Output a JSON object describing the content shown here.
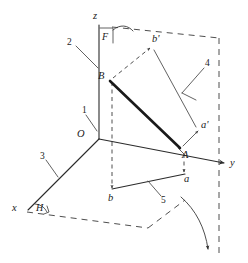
{
  "figure": {
    "background_color": "#ffffff",
    "line_color": "#2b2b2b",
    "dash_color": "#3a3a3a",
    "width": 248,
    "height": 263
  },
  "axes": {
    "x": {
      "label": "x",
      "x": 16,
      "y": 207
    },
    "y": {
      "label": "y",
      "x": 230,
      "y": 160
    },
    "z": {
      "label": "z",
      "x": 93,
      "y": 15
    }
  },
  "origin": {
    "label": "O",
    "x": 84,
    "y": 139
  },
  "planes": {
    "vertical": {
      "label": "F",
      "x": 107,
      "y": 31
    },
    "horizontal": {
      "label": "H",
      "x": 39,
      "y": 206
    }
  },
  "points": [
    {
      "label": "B",
      "x": 107,
      "y": 76,
      "kind": "space-point"
    },
    {
      "label": "A",
      "x": 181,
      "y": 150,
      "kind": "space-point"
    },
    {
      "label": "b'",
      "x": 156,
      "y": 45,
      "kind": "vertical-projection"
    },
    {
      "label": "a'",
      "x": 203,
      "y": 128,
      "kind": "vertical-projection"
    },
    {
      "label": "b",
      "x": 111,
      "y": 195,
      "kind": "horizontal-projection"
    },
    {
      "label": "a",
      "x": 186,
      "y": 178,
      "kind": "horizontal-projection"
    }
  ],
  "callouts": [
    {
      "label": "1",
      "x": 84,
      "y": 110,
      "describes": "axis-of-rotation-ground-line"
    },
    {
      "label": "2",
      "x": 70,
      "y": 41,
      "describes": "vertical-projection-plane-edge"
    },
    {
      "label": "3",
      "x": 42,
      "y": 155,
      "describes": "horizontal-projection-plane-edge"
    },
    {
      "label": "4",
      "x": 208,
      "y": 63,
      "describes": "vertical-projector-rays"
    },
    {
      "label": "5",
      "x": 163,
      "y": 200,
      "describes": "horizontal-projection-of-ab"
    }
  ]
}
